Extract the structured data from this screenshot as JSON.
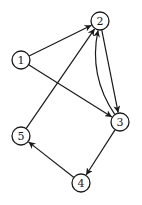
{
  "graph": {
    "directed": true,
    "node_radius": 9,
    "nodes": [
      {
        "id": "1",
        "label": "1",
        "x": 21,
        "y": 60
      },
      {
        "id": "2",
        "label": "2",
        "x": 100,
        "y": 21
      },
      {
        "id": "3",
        "label": "3",
        "x": 120,
        "y": 122
      },
      {
        "id": "4",
        "label": "4",
        "x": 81,
        "y": 183
      },
      {
        "id": "5",
        "label": "5",
        "x": 21,
        "y": 136
      }
    ],
    "edges": [
      {
        "from": "1",
        "to": "2",
        "curve": 0
      },
      {
        "from": "1",
        "to": "3",
        "curve": 0
      },
      {
        "from": "2",
        "to": "3",
        "curve": 0
      },
      {
        "from": "3",
        "to": "2",
        "curve": -22
      },
      {
        "from": "5",
        "to": "2",
        "curve": 0
      },
      {
        "from": "3",
        "to": "4",
        "curve": 0
      },
      {
        "from": "4",
        "to": "5",
        "curve": 0
      }
    ]
  },
  "colors": {
    "stroke": "#1a1a1a",
    "background": "#ffffff"
  }
}
